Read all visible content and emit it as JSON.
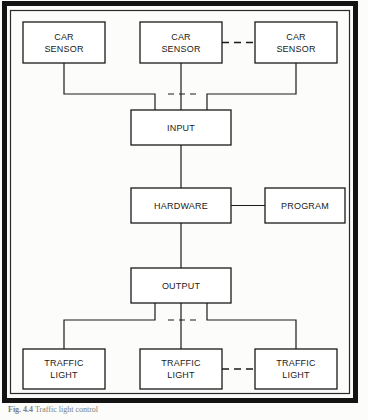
{
  "figure": {
    "caption_number": "Fig. 4.4",
    "caption_text": "Traffic light control",
    "frame_color": "#111111",
    "line_color": "#1a1a1a",
    "background_color": "#fcfcfa"
  },
  "nodes": {
    "sensor_left": "CAR\nSENSOR",
    "sensor_middle": "CAR\nSENSOR",
    "sensor_right": "CAR\nSENSOR",
    "input": "INPUT",
    "hardware": "HARDWARE",
    "program": "PROGRAM",
    "output": "OUTPUT",
    "light_left": "TRAFFIC\nLIGHT",
    "light_middle": "TRAFFIC\nLIGHT",
    "light_right": "TRAFFIC\nLIGHT"
  },
  "diagram_data": {
    "type": "block-diagram",
    "title": "Traffic light control",
    "blocks": [
      {
        "id": "sensor_left",
        "label": "CAR SENSOR",
        "x": 23,
        "y": 22,
        "w": 82,
        "h": 41
      },
      {
        "id": "sensor_middle",
        "label": "CAR SENSOR",
        "x": 140,
        "y": 22,
        "w": 82,
        "h": 41
      },
      {
        "id": "sensor_right",
        "label": "CAR SENSOR",
        "x": 255,
        "y": 22,
        "w": 82,
        "h": 41
      },
      {
        "id": "input",
        "label": "INPUT",
        "x": 131,
        "y": 110,
        "w": 100,
        "h": 35
      },
      {
        "id": "hardware",
        "label": "HARDWARE",
        "x": 131,
        "y": 188,
        "w": 100,
        "h": 35
      },
      {
        "id": "program",
        "label": "PROGRAM",
        "x": 265,
        "y": 188,
        "w": 80,
        "h": 35
      },
      {
        "id": "output",
        "label": "OUTPUT",
        "x": 131,
        "y": 268,
        "w": 100,
        "h": 35
      },
      {
        "id": "light_left",
        "label": "TRAFFIC LIGHT",
        "x": 23,
        "y": 349,
        "w": 82,
        "h": 40
      },
      {
        "id": "light_middle",
        "label": "TRAFFIC LIGHT",
        "x": 140,
        "y": 349,
        "w": 82,
        "h": 40
      },
      {
        "id": "light_right",
        "label": "TRAFFIC LIGHT",
        "x": 255,
        "y": 349,
        "w": 82,
        "h": 40
      }
    ],
    "connections": [
      {
        "from": "sensor_left",
        "to": "input",
        "style": "solid"
      },
      {
        "from": "sensor_middle",
        "to": "input",
        "style": "solid"
      },
      {
        "from": "sensor_right",
        "to": "input",
        "style": "solid"
      },
      {
        "from": "sensor_middle",
        "to": "sensor_right",
        "style": "dashed"
      },
      {
        "from": "input",
        "to": "hardware",
        "style": "solid"
      },
      {
        "from": "hardware",
        "to": "program",
        "style": "solid"
      },
      {
        "from": "hardware",
        "to": "output",
        "style": "solid"
      },
      {
        "from": "output",
        "to": "light_left",
        "style": "solid"
      },
      {
        "from": "output",
        "to": "light_middle",
        "style": "solid"
      },
      {
        "from": "output",
        "to": "light_right",
        "style": "solid"
      },
      {
        "from": "light_middle",
        "to": "light_right",
        "style": "dashed"
      }
    ],
    "bus_dashed_gaps": [
      {
        "location": "sensor-bus",
        "y": 94
      },
      {
        "location": "light-bus",
        "y": 320
      }
    ]
  }
}
